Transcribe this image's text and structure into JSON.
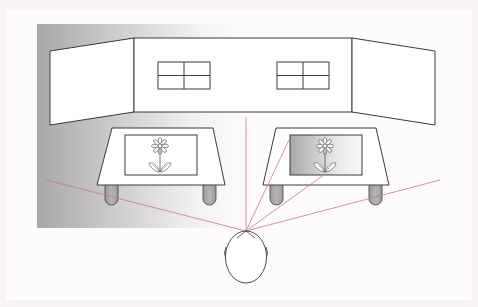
{
  "diagram": {
    "colors": {
      "background": "#f8f3f4",
      "panel": "#fdfbfb",
      "shade_dark": "#a9a7a8",
      "outline": "#3a3a3a",
      "sight_line": "#c9787e",
      "leg_fill": "#a8a8a8",
      "picture_shade_dark": "#a9a9a9",
      "picture_shade_light": "#f4f4f4"
    },
    "wall": {
      "left_panel": "left-wall-panel",
      "center_panel": "center-wall-panel",
      "right_panel": "right-wall-panel",
      "windows": 2
    },
    "tables": [
      {
        "name": "left-table",
        "picture": "flower-picture",
        "shaded": false
      },
      {
        "name": "right-table",
        "picture": "flower-picture",
        "shaded": true
      }
    ],
    "viewer": {
      "name": "viewer-head",
      "eye_point": [
        246,
        231
      ]
    },
    "sight_lines": [
      {
        "to": [
          46,
          180
        ]
      },
      {
        "to": [
          246,
          117
        ]
      },
      {
        "to": [
          289,
          140
        ]
      },
      {
        "to": [
          325,
          174
        ]
      },
      {
        "to": [
          440,
          180
        ]
      }
    ]
  }
}
